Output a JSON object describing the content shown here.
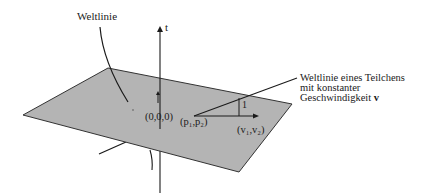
{
  "diagram": {
    "title": "",
    "colors": {
      "plane_fill": "#b4b4b4",
      "plane_edge": "#333333",
      "line": "#1a1a1a",
      "background": "#ffffff"
    },
    "plane": {
      "vertices": [
        [
          108,
          68
        ],
        [
          292,
          104
        ],
        [
          239,
          172
        ],
        [
          23,
          115
        ]
      ]
    },
    "time_axis": {
      "label": "t",
      "x": 160,
      "y_top": 27,
      "y_bottom": 193
    },
    "origin": {
      "label": "(0,0,0)"
    },
    "labels": {
      "worldline": "Weltlinie",
      "particle_worldline_line1": "Weltlinie eines Teilchens",
      "particle_worldline_line2": "mit konstanter",
      "particle_worldline_line3_prefix": "Geschwindigkeit ",
      "particle_worldline_line3_bold": "v",
      "position": "(p₁,p₂)",
      "velocity": "(v₁,v₂)",
      "unit": "1"
    }
  }
}
